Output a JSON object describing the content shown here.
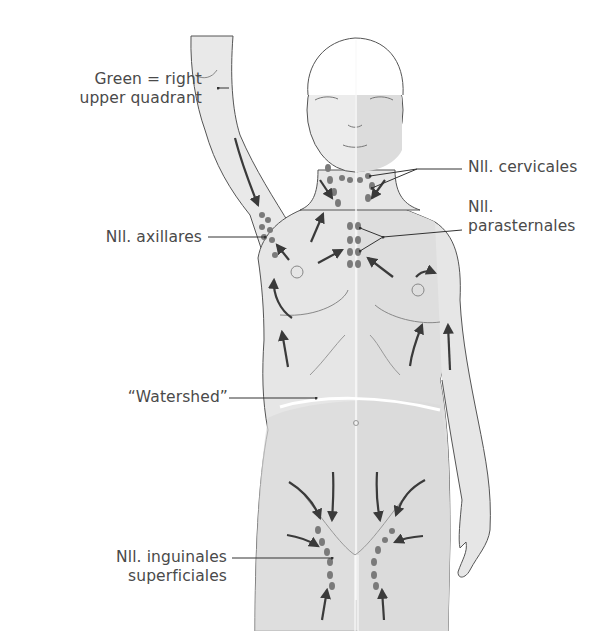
{
  "figure": {
    "colors": {
      "background": "#ffffff",
      "body_fill": "#e8e8e8",
      "shaded_quadrant_fill": "#dcdcdc",
      "outline": "#555555",
      "arrow": "#3a3a3a",
      "node": "#777777",
      "label_text": "#4a4a4a",
      "watershed_line": "#ffffff"
    }
  },
  "labels": {
    "right_upper_quadrant_line1": "Green = right",
    "right_upper_quadrant_line2": "upper quadrant",
    "cervicales_line1": "Nll. cervicales",
    "parasternales_line1": "Nll.",
    "parasternales_line2": "parasternales",
    "axillares": "Nll. axillares",
    "watershed": "“Watershed”",
    "inguinales_line1": "Nll. inguinales",
    "inguinales_line2": "superficiales"
  },
  "node_groups": [
    {
      "name": "Nll. cervicales",
      "region": "neck"
    },
    {
      "name": "Nll. parasternales",
      "region": "sternum"
    },
    {
      "name": "Nll. axillares",
      "region": "right axilla"
    },
    {
      "name": "Nll. inguinales superficiales",
      "region": "groin"
    }
  ]
}
